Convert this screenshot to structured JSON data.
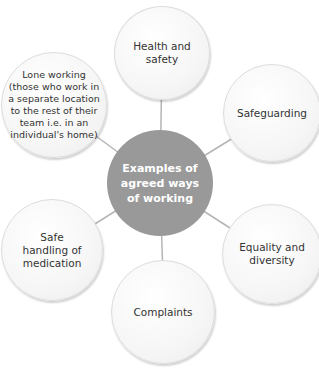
{
  "diagram": {
    "type": "hub-and-spoke",
    "center": {
      "label": "Examples of agreed ways of working",
      "color": "#999999"
    },
    "nodes": [
      {
        "label": "Health and safety"
      },
      {
        "label": "Safeguarding"
      },
      {
        "label": "Equality and diversity"
      },
      {
        "label": "Complaints"
      },
      {
        "label": "Safe handling of medication"
      },
      {
        "label": "Lone working (those who work in a separate location to the rest of their team i.e. in an individual's home)"
      }
    ],
    "connector_color": "#b5b5b5"
  }
}
